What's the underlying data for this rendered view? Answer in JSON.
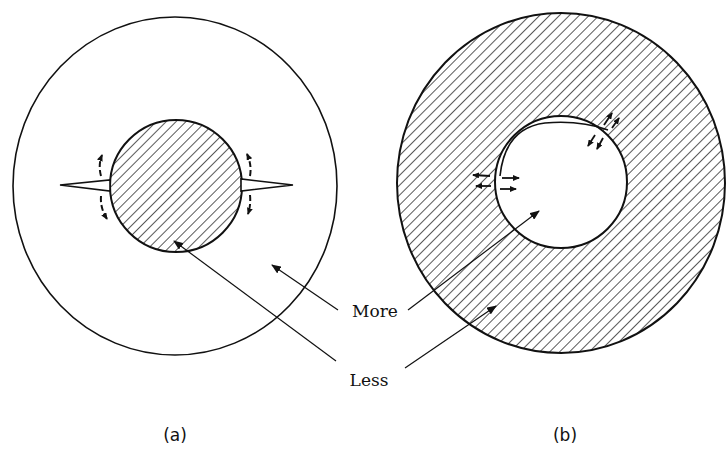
{
  "figure": {
    "panels": [
      {
        "id": "a",
        "caption": "(a)",
        "description": "Hatched solid inclusion inside a clear outer circle, with crack spikes on left and right and curved arrows"
      },
      {
        "id": "b",
        "caption": "(b)",
        "description": "Hatched annulus surrounding a clear hole, with small arrow pairs at the interface and a crescent gap"
      }
    ],
    "labels": {
      "more": "More",
      "less": "Less"
    },
    "colors": {
      "ink": "#111111",
      "background": "#ffffff"
    }
  }
}
